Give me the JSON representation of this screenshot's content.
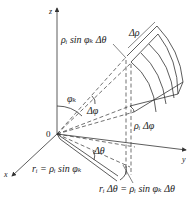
{
  "diagram": {
    "type": "spherical-coordinates-volume-element",
    "axes": {
      "z": "z",
      "y": "y",
      "x": "x",
      "origin": "0"
    },
    "labels": {
      "arc_theta_top": "ρᵢ sin φₖ Δθ",
      "delta_rho": "Δρ",
      "phi_k": "φₖ",
      "delta_phi": "Δφ",
      "rho_delta_phi": "ρᵢ Δφ",
      "r_i_eq": "rᵢ = ρᵢ sin φₖ",
      "delta_theta": "Δθ",
      "r_delta_theta_eq": "rᵢ Δθ = ρᵢ sin φₖ Δθ"
    },
    "colors": {
      "line": "#333333",
      "text": "#222222",
      "background": "#ffffff"
    }
  }
}
